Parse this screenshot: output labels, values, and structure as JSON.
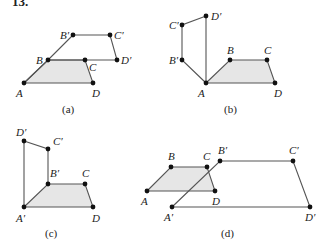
{
  "problem_number": "13.",
  "style": {
    "line_color": "#555555",
    "fill_color": "#e6e6e6",
    "point_color": "#111111"
  },
  "panels": [
    {
      "caption": "(a)",
      "caption_pos": [
        62,
        113
      ],
      "original": {
        "A": [
          24,
          83
        ],
        "B": [
          48,
          60
        ],
        "C": [
          85,
          60
        ],
        "D": [
          93,
          83
        ]
      },
      "image": {
        "B'": [
          73,
          35
        ],
        "C'": [
          110,
          35
        ],
        "D'": [
          117,
          60
        ]
      },
      "labels": [
        {
          "text": "A",
          "x": 16,
          "y": 97
        },
        {
          "text": "B",
          "x": 36,
          "y": 64
        },
        {
          "text": "C",
          "x": 89,
          "y": 71
        },
        {
          "text": "D",
          "x": 92,
          "y": 97
        },
        {
          "text": "B′",
          "x": 60,
          "y": 39
        },
        {
          "text": "C′",
          "x": 114,
          "y": 39
        },
        {
          "text": "D′",
          "x": 121,
          "y": 64
        }
      ]
    },
    {
      "caption": "(b)",
      "caption_pos": [
        224,
        113
      ],
      "original": {
        "A": [
          206,
          83
        ],
        "B": [
          230,
          60
        ],
        "C": [
          267,
          60
        ],
        "D": [
          275,
          83
        ]
      },
      "image": {
        "B'": [
          182,
          60
        ],
        "C'": [
          182,
          25
        ],
        "D'": [
          206,
          16
        ]
      },
      "labels": [
        {
          "text": "A",
          "x": 198,
          "y": 97
        },
        {
          "text": "B",
          "x": 227,
          "y": 54
        },
        {
          "text": "C",
          "x": 264,
          "y": 54
        },
        {
          "text": "D",
          "x": 274,
          "y": 97
        },
        {
          "text": "B′",
          "x": 169,
          "y": 64
        },
        {
          "text": "C′",
          "x": 169,
          "y": 29
        },
        {
          "text": "D′",
          "x": 211,
          "y": 20
        }
      ]
    },
    {
      "caption": "(c)",
      "caption_pos": [
        45,
        237
      ],
      "original": {
        "A′": [
          24,
          207
        ],
        "B′": [
          48,
          184
        ],
        "C": [
          85,
          184
        ],
        "D": [
          93,
          207
        ]
      },
      "image": {
        "C'": [
          48,
          149
        ],
        "D'": [
          24,
          141
        ]
      },
      "labels": [
        {
          "text": "A′",
          "x": 16,
          "y": 222
        },
        {
          "text": "B′",
          "x": 50,
          "y": 177
        },
        {
          "text": "C",
          "x": 82,
          "y": 177
        },
        {
          "text": "D",
          "x": 92,
          "y": 222
        },
        {
          "text": "C′",
          "x": 53,
          "y": 145
        },
        {
          "text": "D′",
          "x": 16,
          "y": 136
        }
      ]
    },
    {
      "caption": "(d)",
      "caption_pos": [
        221,
        237
      ],
      "original": {
        "A": [
          147,
          191
        ],
        "B": [
          171,
          167
        ],
        "C": [
          207,
          167
        ],
        "D": [
          215,
          191
        ]
      },
      "image": {
        "A'": [
          172,
          207
        ],
        "B'": [
          220,
          161
        ],
        "C'": [
          293,
          161
        ],
        "D'": [
          310,
          207
        ]
      },
      "labels": [
        {
          "text": "A",
          "x": 141,
          "y": 205
        },
        {
          "text": "B",
          "x": 168,
          "y": 160
        },
        {
          "text": "C",
          "x": 203,
          "y": 160
        },
        {
          "text": "D",
          "x": 212,
          "y": 205
        },
        {
          "text": "A′",
          "x": 164,
          "y": 221
        },
        {
          "text": "B′",
          "x": 218,
          "y": 154
        },
        {
          "text": "C′",
          "x": 289,
          "y": 154
        },
        {
          "text": "D′",
          "x": 305,
          "y": 221
        }
      ]
    }
  ]
}
